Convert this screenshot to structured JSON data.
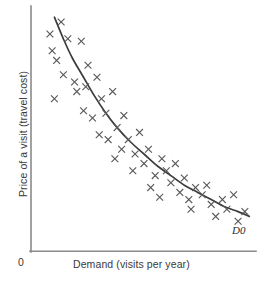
{
  "chart_data": {
    "type": "scatter",
    "title": "",
    "subtitle": "",
    "xlabel": "Demand (visits per year)",
    "ylabel": "Price of a visit (travel cost)",
    "origin_label": "0",
    "grid": false,
    "legend": false,
    "axis_style": "open-L",
    "xlim": [
      0,
      100
    ],
    "ylim": [
      0,
      100
    ],
    "xticks": [],
    "yticks": [],
    "annotations": [
      {
        "name": "demand-curve-label",
        "text": "D0",
        "x": 90,
        "y": 13,
        "style": "italic"
      }
    ],
    "series": [
      {
        "name": "observations",
        "marker": "x",
        "color": "#5a5a5a",
        "points": [
          [
            8,
            90
          ],
          [
            13,
            95
          ],
          [
            9,
            83
          ],
          [
            11,
            79
          ],
          [
            16,
            88
          ],
          [
            14,
            73
          ],
          [
            10,
            63
          ],
          [
            22,
            87
          ],
          [
            25,
            77
          ],
          [
            19,
            70
          ],
          [
            20,
            66
          ],
          [
            24,
            68
          ],
          [
            29,
            72
          ],
          [
            23,
            58
          ],
          [
            27,
            55
          ],
          [
            31,
            63
          ],
          [
            33,
            57
          ],
          [
            36,
            66
          ],
          [
            30,
            48
          ],
          [
            34,
            46
          ],
          [
            38,
            51
          ],
          [
            41,
            56
          ],
          [
            40,
            42
          ],
          [
            37,
            38
          ],
          [
            43,
            46
          ],
          [
            46,
            40
          ],
          [
            48,
            49
          ],
          [
            45,
            33
          ],
          [
            50,
            36
          ],
          [
            52,
            42
          ],
          [
            55,
            31
          ],
          [
            53,
            26
          ],
          [
            58,
            38
          ],
          [
            60,
            33
          ],
          [
            62,
            28
          ],
          [
            57,
            22
          ],
          [
            64,
            36
          ],
          [
            66,
            24
          ],
          [
            68,
            30
          ],
          [
            70,
            21
          ],
          [
            73,
            26
          ],
          [
            71,
            17
          ],
          [
            76,
            23
          ],
          [
            78,
            27
          ],
          [
            80,
            19
          ],
          [
            82,
            14
          ],
          [
            85,
            21
          ],
          [
            87,
            17
          ],
          [
            90,
            23
          ],
          [
            92,
            12
          ],
          [
            95,
            16
          ]
        ]
      }
    ],
    "curve": {
      "name": "demand-curve",
      "label": "D0",
      "description": "smooth downward-sloping convex demand curve",
      "color": "#3c3c3c",
      "points": [
        [
          10,
          97
        ],
        [
          14,
          88
        ],
        [
          18,
          80
        ],
        [
          23,
          72
        ],
        [
          28,
          64
        ],
        [
          33,
          57
        ],
        [
          38,
          51
        ],
        [
          44,
          45
        ],
        [
          50,
          40
        ],
        [
          56,
          35
        ],
        [
          62,
          31
        ],
        [
          68,
          27
        ],
        [
          74,
          24
        ],
        [
          80,
          21
        ],
        [
          86,
          18
        ],
        [
          92,
          16
        ],
        [
          97,
          14
        ]
      ]
    }
  },
  "labels": {
    "y_axis": "Price of a visit (travel cost)",
    "x_axis": "Demand (visits per year)",
    "origin": "0",
    "curve": "D0"
  },
  "colors": {
    "axis": "#8a8a8a",
    "curve": "#3c3c3c",
    "marker": "#5a5a5a",
    "text": "#3a3a3a",
    "background": "#ffffff"
  }
}
